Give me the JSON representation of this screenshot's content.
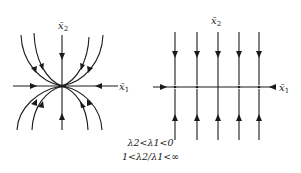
{
  "figure": {
    "left_panel": {
      "title": "stable node (improper, tangent to x1 axis)",
      "axis_x_label": "x̄",
      "axis_x_sub": "1",
      "axis_y_label": "x̄",
      "axis_y_sub": "2"
    },
    "right_panel": {
      "title": "degenerate: line of equilibria / flow along x2",
      "axis_x_label": "x̄",
      "axis_x_sub": "1",
      "axis_y_label": "x̄",
      "axis_y_sub": "2",
      "vertical_trajectories": 5
    },
    "caption": {
      "line1": "λ2<λ1<0",
      "line2": "1<λ2/λ1<∞"
    },
    "colors": {
      "ink": "#1a1a1a",
      "background": "#ffffff"
    }
  }
}
